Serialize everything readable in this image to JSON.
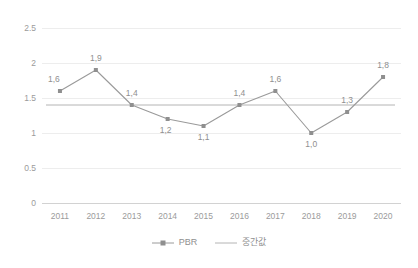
{
  "chart_data": {
    "type": "line",
    "title": "",
    "xlabel": "",
    "ylabel": "",
    "categories": [
      "2011",
      "2012",
      "2013",
      "2014",
      "2015",
      "2016",
      "2017",
      "2018",
      "2019",
      "2020"
    ],
    "series": [
      {
        "name": "PBR",
        "values": [
          1.6,
          1.9,
          1.4,
          1.2,
          1.1,
          1.4,
          1.6,
          1.0,
          1.3,
          1.8
        ],
        "labels": [
          "1,6",
          "1,9",
          "1,4",
          "1,2",
          "1,1",
          "1,4",
          "1,6",
          "1,0",
          "1,3",
          "1,8"
        ],
        "color": "#9a9a9a",
        "marker": "square"
      },
      {
        "name": "중간값",
        "constant_value": 1.4,
        "color": "#b4b4b4",
        "marker": "none"
      }
    ],
    "ylim": [
      0,
      2.5
    ],
    "yticks": [
      0,
      0.5,
      1,
      1.5,
      2,
      2.5
    ],
    "ytick_labels": [
      "0",
      "0.5",
      "1",
      "1.5",
      "2",
      "2.5"
    ],
    "grid": true,
    "legend_position": "bottom"
  },
  "legend": {
    "items": [
      {
        "label": "PBR"
      },
      {
        "label": "중간값"
      }
    ]
  }
}
